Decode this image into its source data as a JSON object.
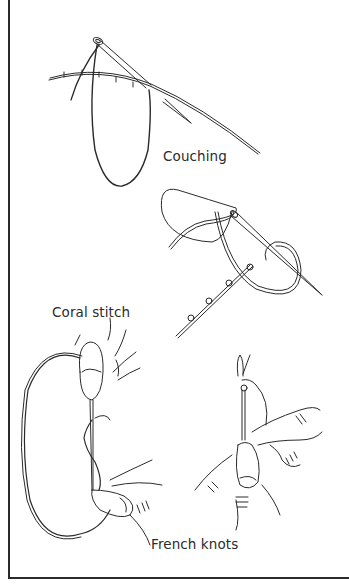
{
  "figure": {
    "labels": {
      "couching": "Couching",
      "coral_stitch": "Coral stitch",
      "french_knots": "French knots"
    },
    "colors": {
      "line": "#2a2a2a",
      "background": "#ffffff"
    }
  }
}
